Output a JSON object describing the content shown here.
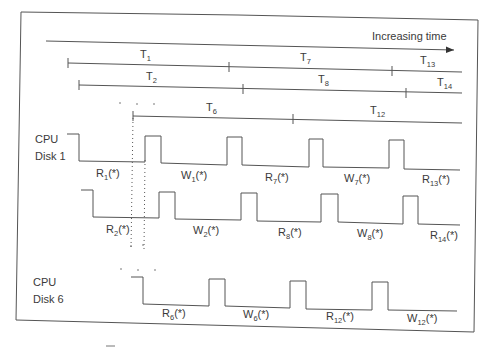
{
  "diagram": {
    "type": "timing-diagram",
    "time_axis": {
      "label": "Increasing time"
    },
    "intervals": [
      {
        "row": 1,
        "labels": [
          {
            "base": "T",
            "sub": "1"
          },
          {
            "base": "T",
            "sub": "7"
          },
          {
            "base": "T",
            "sub": "13"
          }
        ]
      },
      {
        "row": 2,
        "labels": [
          {
            "base": "T",
            "sub": "2"
          },
          {
            "base": "T",
            "sub": "8"
          },
          {
            "base": "T",
            "sub": "14"
          }
        ]
      },
      {
        "row": 3,
        "labels": [
          {
            "base": "T",
            "sub": "6"
          },
          {
            "base": "T",
            "sub": "12"
          }
        ]
      }
    ],
    "ellipsis": "· · ·",
    "groups": [
      {
        "cpu_label": "CPU",
        "disk_label": "Disk 1",
        "waveforms": [
          {
            "labels": [
              {
                "base": "R",
                "sub": "1",
                "suffix": "(*)"
              },
              {
                "base": "W",
                "sub": "1",
                "suffix": "(*)"
              },
              {
                "base": "R",
                "sub": "7",
                "suffix": "(*)"
              },
              {
                "base": "W",
                "sub": "7",
                "suffix": "(*)"
              },
              {
                "base": "R",
                "sub": "13",
                "suffix": "(*)"
              }
            ]
          },
          {
            "labels": [
              {
                "base": "R",
                "sub": "2",
                "suffix": "(*)"
              },
              {
                "base": "W",
                "sub": "2",
                "suffix": "(*)"
              },
              {
                "base": "R",
                "sub": "8",
                "suffix": "(*)"
              },
              {
                "base": "W",
                "sub": "8",
                "suffix": "(*)"
              },
              {
                "base": "R",
                "sub": "14",
                "suffix": "(*)"
              }
            ]
          }
        ]
      },
      {
        "cpu_label": "CPU",
        "disk_label": "Disk 6",
        "waveforms": [
          {
            "labels": [
              {
                "base": "R",
                "sub": "6",
                "suffix": "(*)"
              },
              {
                "base": "W",
                "sub": "6",
                "suffix": "(*)"
              },
              {
                "base": "R",
                "sub": "12",
                "suffix": "(*)"
              },
              {
                "base": "W",
                "sub": "12",
                "suffix": "(*)"
              }
            ]
          }
        ]
      }
    ]
  }
}
